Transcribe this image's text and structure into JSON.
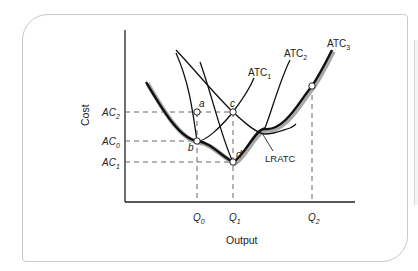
{
  "diagram": {
    "title": "",
    "axes": {
      "y_label": "Cost",
      "x_label": "Output"
    },
    "y_ticks": [
      {
        "id": "AC2",
        "base": "AC",
        "sub": "2"
      },
      {
        "id": "AC0",
        "base": "AC",
        "sub": "0"
      },
      {
        "id": "AC1",
        "base": "AC",
        "sub": "1"
      }
    ],
    "x_ticks": [
      {
        "id": "Q0",
        "base": "Q",
        "sub": "0"
      },
      {
        "id": "Q1",
        "base": "Q",
        "sub": "1"
      },
      {
        "id": "Q2",
        "base": "Q",
        "sub": "2"
      }
    ],
    "curves": [
      {
        "id": "ATC1",
        "base": "ATC",
        "sub": "1"
      },
      {
        "id": "ATC2",
        "base": "ATC",
        "sub": "2"
      },
      {
        "id": "ATC3",
        "base": "ATC",
        "sub": "3"
      },
      {
        "id": "LRATC",
        "label": "LRATC"
      }
    ],
    "points": [
      {
        "id": "a",
        "label": "a"
      },
      {
        "id": "b",
        "label": "b"
      },
      {
        "id": "c",
        "label": "c"
      },
      {
        "id": "d",
        "label": "d"
      }
    ],
    "colors": {
      "curve": "#111111",
      "lratc_shadow": "#9a9a9a",
      "guide": "#555555",
      "card_border": "#c9c9c9"
    }
  }
}
